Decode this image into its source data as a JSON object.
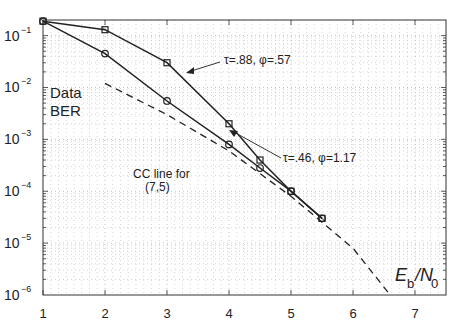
{
  "chart_data": {
    "type": "line",
    "title": "",
    "xlabel": "Eb/N0",
    "ylabel": "Data BER",
    "xlim": [
      1,
      7.5
    ],
    "ylim": [
      1e-06,
      0.2
    ],
    "yscale": "log",
    "grid": true,
    "x_ticks": [
      "1",
      "2",
      "3",
      "4",
      "5",
      "6",
      "7"
    ],
    "y_ticks": [
      "10^-1",
      "10^-2",
      "10^-3",
      "10^-4",
      "10^-5",
      "10^-6"
    ],
    "series": [
      {
        "name": "τ=.88, φ=.57",
        "marker": "square",
        "style": "solid",
        "x": [
          1,
          2,
          3,
          4,
          4.5,
          5,
          5.5
        ],
        "values": [
          0.19,
          0.13,
          0.03,
          0.002,
          0.0004,
          0.0001,
          3e-05
        ]
      },
      {
        "name": "τ=.46, φ=1.17",
        "marker": "circle",
        "style": "solid",
        "x": [
          1,
          2,
          3,
          4,
          4.5,
          5,
          5.5
        ],
        "values": [
          0.19,
          0.045,
          0.0055,
          0.0008,
          0.00028,
          0.0001,
          3e-05
        ]
      },
      {
        "name": "CC line for (7,5)",
        "marker": "none",
        "style": "dashed",
        "x": [
          2,
          3,
          4,
          5,
          6,
          6.6
        ],
        "values": [
          0.012,
          0.003,
          0.0006,
          8e-05,
          8e-06,
          1e-06
        ]
      }
    ],
    "annotations": [
      {
        "text": "Data",
        "x": 1.15,
        "y": 0.03
      },
      {
        "text": "BER",
        "x": 1.15,
        "y": 0.012
      },
      {
        "text": "τ=.88, φ=.57",
        "x": 3.9,
        "y": 0.05,
        "arrow_to": [
          3.35,
          0.012
        ]
      },
      {
        "text": "τ=.46, φ=1.17",
        "x": 4.1,
        "y": 0.0025,
        "arrow_to": [
          3.6,
          0.001
        ]
      },
      {
        "text": "CC line for",
        "x": 3.0,
        "y": 0.00095
      },
      {
        "text": "(7,5)",
        "x": 3.15,
        "y": 0.00045
      },
      {
        "text": "Eb/N0",
        "x": 6.7,
        "y": 3e-06
      }
    ]
  },
  "labels": {
    "data": "Data",
    "ber": "BER",
    "ann1": "τ=.88, φ=.57",
    "ann2": "τ=.46, φ=1.17",
    "cc1": "CC line for",
    "cc2": "(7,5)",
    "xE": "E",
    "xb": "b",
    "xslash": "/N",
    "x0": "0"
  }
}
